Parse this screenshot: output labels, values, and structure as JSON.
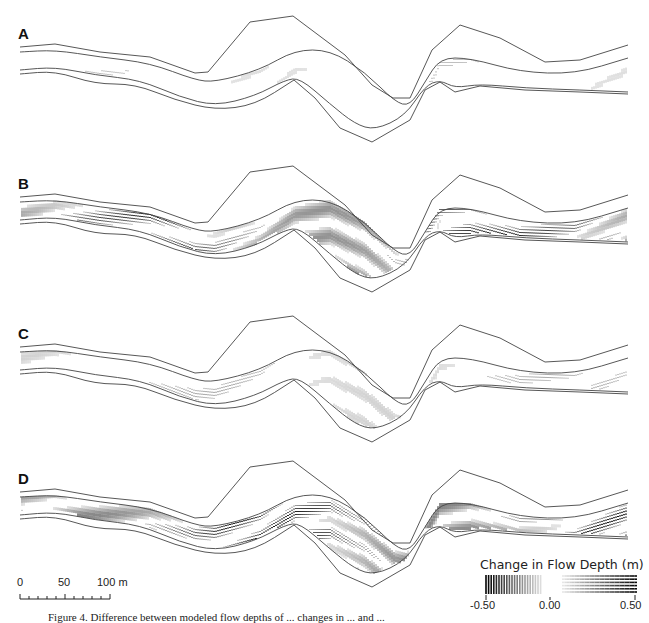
{
  "figure": {
    "panels": [
      {
        "label": "A",
        "top": 0,
        "intensity": 0.25,
        "pattern_mix": "mostly-horizontal-light"
      },
      {
        "label": "B",
        "top": 160,
        "intensity": 0.85,
        "pattern_mix": "strong-both"
      },
      {
        "label": "C",
        "top": 300,
        "intensity": 0.35,
        "pattern_mix": "light-mixed"
      },
      {
        "label": "D",
        "top": 450,
        "intensity": 0.95,
        "pattern_mix": "strong-both"
      }
    ],
    "scale_bar": {
      "labels": [
        "0",
        "50",
        "100 m"
      ],
      "length_m": 100
    },
    "legend": {
      "title": "Change in Flow Depth (m)",
      "ticks": [
        "-0.50",
        "0.00",
        "0.50"
      ],
      "negative_pattern": "vertical-hatch",
      "positive_pattern": "horizontal-hatch"
    },
    "caption": "Figure 4. Difference between modeled flow depths of ... changes in ... and ..."
  },
  "colors": {
    "line": "#444444",
    "hatch_dark": "#000000",
    "background": "#ffffff"
  }
}
